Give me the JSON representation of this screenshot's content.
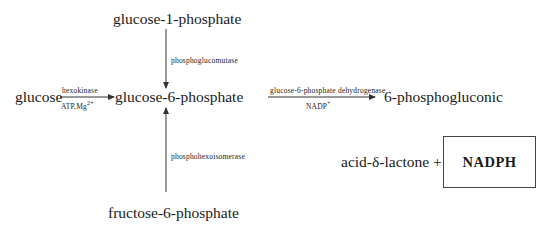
{
  "diagram": {
    "type": "metabolic-pathway",
    "nodes": {
      "glucose": "glucose",
      "g1p": "glucose-1-phosphate",
      "g6p": "glucose-6-phosphate",
      "f6p": "fructose-6-phosphate",
      "product_line1": "6-phosphogluconic",
      "product_line2": "acid-δ-lactone +",
      "nadph": "NADPH"
    },
    "edges": {
      "hexokinase": {
        "enzyme": "hexokinase",
        "cofactor": "ATP,Mg",
        "cofactor_sup": "2+"
      },
      "phosphoglucomutase": {
        "enzyme": "phosphoglucomutase"
      },
      "phosphohexoisomerase": {
        "enzyme": "phosphohexoisomerase"
      },
      "g6pd": {
        "enzyme": "glucose-6-phosphate dehydrogenase",
        "cofactor": "NADP",
        "cofactor_sup": "+"
      }
    },
    "colors": {
      "line": "#333333",
      "text": "#1a1a1a",
      "box_border": "#444444"
    }
  }
}
